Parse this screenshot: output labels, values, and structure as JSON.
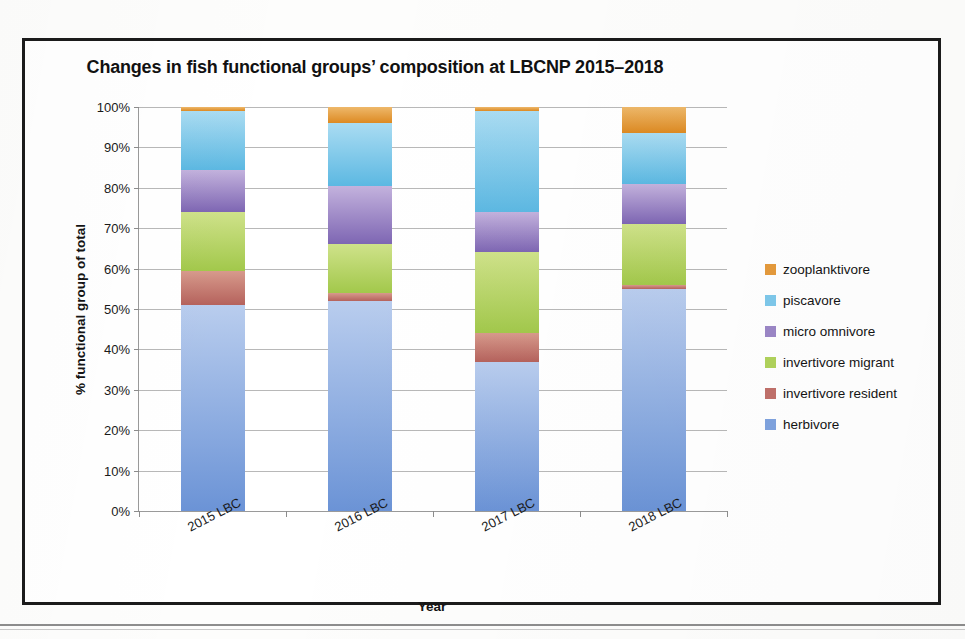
{
  "chart_data": {
    "type": "bar",
    "subtype": "stacked-100-percent",
    "title": "Changes in fish functional groups’ composition at LBCNP 2015–2018",
    "xlabel": "Year",
    "ylabel": "% functional group of total",
    "categories": [
      "2015 LBC",
      "2016 LBC",
      "2017 LBC",
      "2018 LBC"
    ],
    "ylim": [
      0,
      100
    ],
    "ytick_labels": [
      "0%",
      "10%",
      "20%",
      "30%",
      "40%",
      "50%",
      "60%",
      "70%",
      "80%",
      "90%",
      "100%"
    ],
    "ytick_values": [
      0,
      10,
      20,
      30,
      40,
      50,
      60,
      70,
      80,
      90,
      100
    ],
    "grid": true,
    "legend_position": "right",
    "legend_order": [
      "zooplanktivore",
      "piscavore",
      "micro omnivore",
      "invertivore migrant",
      "invertivore resident",
      "herbivore"
    ],
    "series": [
      {
        "name": "herbivore",
        "color": "#7fa3de",
        "color_top": "#b9cdee",
        "color_bottom": "#6b93d6",
        "values": [
          51.0,
          52.0,
          37.0,
          55.0
        ]
      },
      {
        "name": "invertivore resident",
        "color": "#c0706a",
        "color_top": "#d79a8c",
        "color_bottom": "#b5625c",
        "values": [
          8.5,
          2.0,
          7.0,
          1.0
        ]
      },
      {
        "name": "invertivore migrant",
        "color": "#b0d25c",
        "color_top": "#cfe28a",
        "color_bottom": "#a2c84b",
        "values": [
          14.5,
          12.0,
          20.0,
          15.0
        ]
      },
      {
        "name": "micro omnivore",
        "color": "#9b86c6",
        "color_top": "#c3b2dd",
        "color_bottom": "#7e66b3",
        "values": [
          10.5,
          14.5,
          10.0,
          10.0
        ]
      },
      {
        "name": "piscavore",
        "color": "#7ec8ea",
        "color_top": "#aadcf2",
        "color_bottom": "#5cb8e2",
        "values": [
          14.5,
          15.5,
          25.0,
          12.5
        ]
      },
      {
        "name": "zooplanktivore",
        "color": "#e49a3c",
        "color_top": "#eeb86a",
        "color_bottom": "#dd8a22",
        "values": [
          1.0,
          4.0,
          1.0,
          6.5
        ]
      }
    ]
  },
  "axes": {
    "y_title": "% functional group of total",
    "x_title": "Year"
  },
  "legend": {
    "items": [
      {
        "label": "zooplanktivore",
        "color": "#e49a3c"
      },
      {
        "label": "piscavore",
        "color": "#7ec8ea"
      },
      {
        "label": "micro omnivore",
        "color": "#9b86c6"
      },
      {
        "label": "invertivore migrant",
        "color": "#b0d25c"
      },
      {
        "label": "invertivore resident",
        "color": "#c0706a"
      },
      {
        "label": "herbivore",
        "color": "#7fa3de"
      }
    ]
  }
}
